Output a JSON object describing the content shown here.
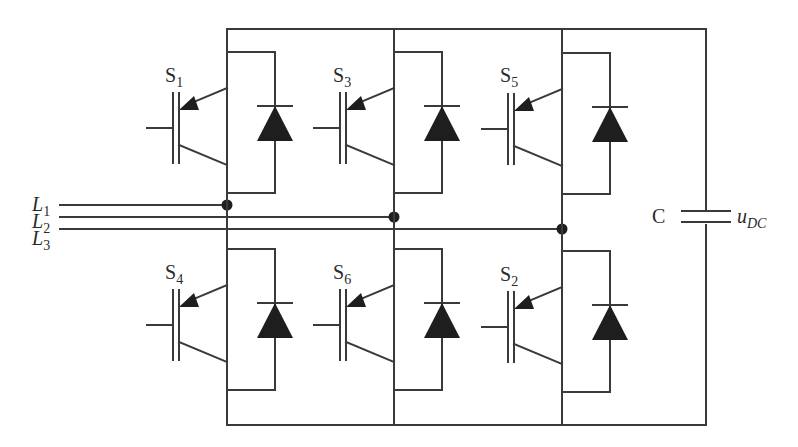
{
  "diagram": {
    "type": "three-phase IGBT bridge inverter",
    "colors": {
      "wire": "#3a3a3a",
      "fill": "#1e1e1e",
      "background": "#ffffff"
    },
    "switches": [
      {
        "id": "S1",
        "base": "S",
        "sub": "1",
        "position": "upper",
        "leg": 1
      },
      {
        "id": "S3",
        "base": "S",
        "sub": "3",
        "position": "upper",
        "leg": 2
      },
      {
        "id": "S5",
        "base": "S",
        "sub": "5",
        "position": "upper",
        "leg": 3
      },
      {
        "id": "S4",
        "base": "S",
        "sub": "4",
        "position": "lower",
        "leg": 1
      },
      {
        "id": "S6",
        "base": "S",
        "sub": "6",
        "position": "lower",
        "leg": 2
      },
      {
        "id": "S2",
        "base": "S",
        "sub": "2",
        "position": "lower",
        "leg": 3
      }
    ],
    "lines": [
      {
        "id": "L1",
        "base": "L",
        "sub": "1",
        "connects_leg": 1
      },
      {
        "id": "L2",
        "base": "L",
        "sub": "2",
        "connects_leg": 2
      },
      {
        "id": "L3",
        "base": "L",
        "sub": "3",
        "connects_leg": 3
      }
    ],
    "capacitor": {
      "label": "C",
      "voltage_base": "u",
      "voltage_sub": "DC"
    }
  }
}
